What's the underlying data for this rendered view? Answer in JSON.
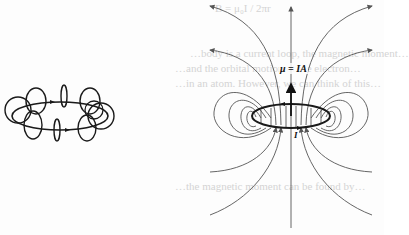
{
  "figure": {
    "left_diagram": {
      "description": "Current ring with circular magnetic field loops encircling the wire",
      "ring_color": "#1a1a1a"
    },
    "right_diagram": {
      "description": "Magnetic dipole field lines of a current loop",
      "moment_label": "μ = IA",
      "current_label": "I",
      "loop_color": "#1a1a1a",
      "field_line_color": "#555555"
    }
  },
  "bleed_through_text": [
    "B = μ₀I / 2πr",
    "…body is a current loop, the magnetic moment…",
    "…and the orbital motion of the electron…",
    "…in an atom. However, we can think of this…",
    "…the magnetic moment can be found by…"
  ]
}
